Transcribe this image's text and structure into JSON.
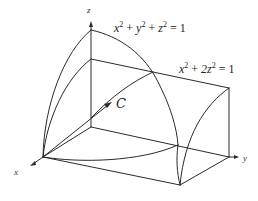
{
  "diagram": {
    "type": "3d-surface-intersection",
    "axes": {
      "x": "x",
      "y": "y",
      "z": "z"
    },
    "surfaces": [
      {
        "name": "sphere",
        "equation": {
          "t1": "x",
          "e1": "2",
          "op1": "+",
          "t2": "y",
          "e2": "2",
          "op2": "+",
          "t3": "z",
          "e3": "2",
          "rhs": "= 1"
        }
      },
      {
        "name": "elliptic-cylinder",
        "equation": {
          "t1": "x",
          "e1": "2",
          "op1": "+",
          "t2": "2z",
          "e2": "2",
          "rhs": "= 1"
        }
      }
    ],
    "curve_label": "C",
    "colors": {
      "stroke": "#2a2a2a",
      "background": "#ffffff"
    }
  }
}
